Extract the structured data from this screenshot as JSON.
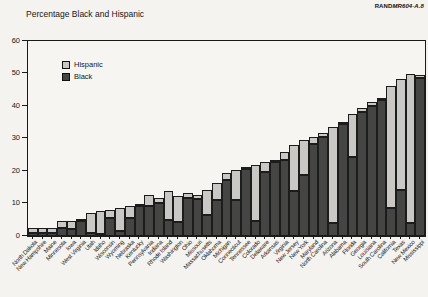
{
  "page": {
    "source_prefix": "RAND",
    "source_id": "MR604-A.8"
  },
  "legend": {
    "items": [
      {
        "label": "Hispanic",
        "color": "#c9c8c4"
      },
      {
        "label": "Black",
        "color": "#454543"
      }
    ]
  },
  "chart_data": {
    "type": "bar",
    "stacked": true,
    "title": "Percentage Black and Hispanic",
    "xlabel": "",
    "ylabel": "",
    "ylim": [
      0,
      60
    ],
    "yticks": [
      0,
      10,
      20,
      30,
      40,
      50,
      60
    ],
    "grid": false,
    "legend_position": "upper-left-inside",
    "categories": [
      "North Dakota",
      "New Hampshire",
      "Maine",
      "Minnesota",
      "Iowa",
      "West Virginia",
      "Utah",
      "Idaho",
      "Wisconsin",
      "Wyoming",
      "Nebraska",
      "Kentucky",
      "Pennsylvania",
      "Indiana",
      "Rhode Island",
      "Washington",
      "Ohio",
      "Missouri",
      "Massachusetts",
      "Oklahoma",
      "Michigan",
      "Connecticut",
      "Tennessee",
      "Colorado",
      "Delaware",
      "Arkansas",
      "Virginia",
      "New Jersey",
      "New York",
      "Maryland",
      "North Carolina",
      "Arizona",
      "Alabama",
      "Florida",
      "Georgia",
      "Louisiana",
      "South Carolina",
      "California",
      "Texas",
      "New Mexico",
      "Mississippi"
    ],
    "series": [
      {
        "name": "Black",
        "color": "#454543",
        "values": [
          1.0,
          0.9,
          0.8,
          2.6,
          2.3,
          4.6,
          0.9,
          0.6,
          5.6,
          1.5,
          5.6,
          9.3,
          9.2,
          10.2,
          4.8,
          4.2,
          11.7,
          11.5,
          6.6,
          11.0,
          17.2,
          11.1,
          20.8,
          4.5,
          19.8,
          22.8,
          23.3,
          14.0,
          18.7,
          28.4,
          30.4,
          3.9,
          34.5,
          24.2,
          38.2,
          40.1,
          42.0,
          8.7,
          14.3,
          4.0,
          48.5
        ]
      },
      {
        "name": "Hispanic",
        "color": "#c9c8c4",
        "values": [
          1.5,
          1.6,
          1.6,
          2.0,
          2.3,
          0.5,
          6.2,
          7.0,
          2.5,
          7.1,
          3.5,
          0.4,
          3.5,
          1.5,
          8.9,
          8.0,
          1.5,
          1.2,
          7.6,
          5.2,
          2.1,
          9.2,
          0.5,
          17.3,
          3.0,
          0.5,
          2.5,
          14.0,
          10.7,
          2.0,
          1.4,
          29.5,
          0.6,
          13.3,
          1.2,
          1.2,
          0.6,
          37.5,
          34.0,
          45.7,
          1.0
        ]
      }
    ]
  }
}
